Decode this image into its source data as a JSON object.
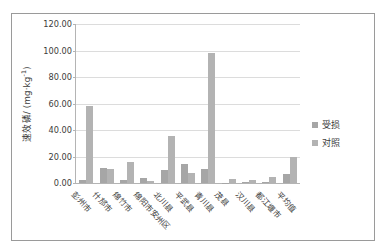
{
  "chart_data": {
    "type": "bar",
    "title": "",
    "xlabel": "",
    "ylabel": "速效磷/ (mg·kg-1)",
    "ylabel_base": "速效磷/ (mg·kg",
    "ylabel_sup": "-1",
    "ylabel_tail": ")",
    "ylim": [
      0,
      120
    ],
    "ytick_step": 20,
    "grid": true,
    "legend_position": "right",
    "ytick_labels": [
      "0.00",
      "20.00",
      "40.00",
      "60.00",
      "80.00",
      "100.00",
      "120.00"
    ],
    "ytick_values": [
      0,
      20,
      40,
      60,
      80,
      100,
      120
    ],
    "categories": [
      "彭州市",
      "什邡市",
      "绵竹市",
      "绵阳市安州区",
      "北川县",
      "平武县",
      "青川县",
      "茂县",
      "汉川县",
      "都江堰市",
      "平均值"
    ],
    "series": [
      {
        "name": "受损",
        "color": "#a6a6a6",
        "values": [
          2.0,
          11.0,
          2.5,
          3.5,
          10.2,
          14.0,
          10.3,
          0.3,
          0.4,
          0.5,
          7.0
        ]
      },
      {
        "name": "对照",
        "color": "#b3b3b3",
        "values": [
          58.0,
          10.5,
          15.5,
          1.5,
          35.3,
          7.5,
          98.2,
          3.0,
          2.5,
          4.5,
          20.0
        ]
      }
    ]
  },
  "legend": {
    "items": [
      {
        "label": "受损"
      },
      {
        "label": "对照"
      }
    ]
  },
  "colors": {
    "bar_damaged": "#a6a6a6",
    "bar_control": "#b3b3b3",
    "frame": "#9a9a9a",
    "gridline": "#dcdcdc",
    "text": "#3b3b3b"
  }
}
